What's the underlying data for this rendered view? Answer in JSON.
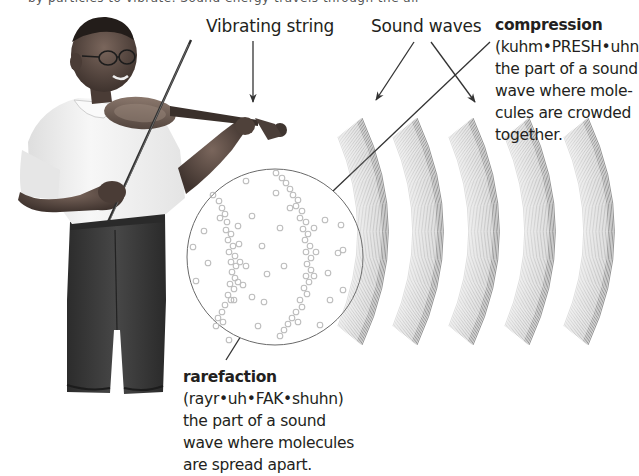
{
  "top_cutoff_text": "by particles to vibrate. Sound energy travels through the air",
  "labels": {
    "vibrating_string": "Vibrating string",
    "sound_waves": "Sound waves"
  },
  "compression": {
    "term": "compression",
    "lines": [
      "(kuhm•PRESH•uhn",
      "the part of a sound",
      "wave where mole-",
      "cules are crowded",
      "together."
    ]
  },
  "rarefaction": {
    "term": "rarefaction",
    "lines": [
      "(rayr•uh•FAK•shuhn)",
      "the part of a sound",
      "wave where molecules",
      "are spread apart."
    ]
  },
  "figure": {
    "wave_bands": 5,
    "colors": {
      "text": "#231f20",
      "arrow": "#333333",
      "wave_line": "#555555",
      "molecule": "#b8b8b8",
      "circle": "#666666",
      "shirt": "#f2f2f2",
      "jeans": "#3a3a3a",
      "skin": "#5a4a42",
      "violin": "#6b5a50"
    }
  }
}
